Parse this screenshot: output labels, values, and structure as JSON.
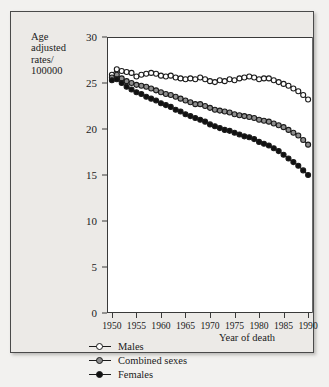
{
  "figure": {
    "y_axis_title_lines": [
      "Age",
      "adjusted",
      "rates/",
      "100000"
    ],
    "x_axis_title": "Year of death"
  },
  "legend": {
    "items": [
      {
        "label": "Males",
        "marker": "open-circle-icon",
        "color": "#ffffff"
      },
      {
        "label": "Combined sexes",
        "marker": "half-circle-icon",
        "color": "#8e8e8e"
      },
      {
        "label": "Females",
        "marker": "filled-circle-icon",
        "color": "#111111"
      }
    ]
  },
  "chart_data": {
    "type": "line",
    "title": "",
    "xlabel": "Year of death",
    "ylabel": "Age adjusted rates/ 100000",
    "xlim": [
      1949,
      1991
    ],
    "ylim": [
      0,
      30
    ],
    "xticks": [
      1950,
      1955,
      1960,
      1965,
      1970,
      1975,
      1980,
      1985,
      1990
    ],
    "yticks": [
      0,
      5,
      10,
      15,
      20,
      25,
      30
    ],
    "grid": false,
    "legend_position": "below-axes-left",
    "x": [
      1950,
      1951,
      1952,
      1953,
      1954,
      1955,
      1956,
      1957,
      1958,
      1959,
      1960,
      1961,
      1962,
      1963,
      1964,
      1965,
      1966,
      1967,
      1968,
      1969,
      1970,
      1971,
      1972,
      1973,
      1974,
      1975,
      1976,
      1977,
      1978,
      1979,
      1980,
      1981,
      1982,
      1983,
      1984,
      1985,
      1986,
      1987,
      1988,
      1989,
      1990
    ],
    "series": [
      {
        "name": "Males",
        "marker": "open-circle",
        "values": [
          25.9,
          26.5,
          26.3,
          26.2,
          26.1,
          25.7,
          25.9,
          26.0,
          26.1,
          26.0,
          25.8,
          25.7,
          25.8,
          25.6,
          25.5,
          25.4,
          25.5,
          25.4,
          25.6,
          25.4,
          25.2,
          25.1,
          25.3,
          25.2,
          25.4,
          25.3,
          25.5,
          25.6,
          25.7,
          25.6,
          25.4,
          25.5,
          25.5,
          25.3,
          25.1,
          24.9,
          24.7,
          24.4,
          24.1,
          23.7,
          23.2
        ]
      },
      {
        "name": "Combined sexes",
        "marker": "half-circle",
        "values": [
          25.6,
          25.9,
          25.5,
          25.2,
          25.0,
          24.8,
          24.7,
          24.6,
          24.4,
          24.2,
          24.0,
          23.8,
          23.7,
          23.5,
          23.3,
          23.1,
          22.9,
          22.7,
          22.7,
          22.5,
          22.3,
          22.1,
          22.0,
          21.9,
          21.8,
          21.6,
          21.5,
          21.4,
          21.3,
          21.2,
          21.0,
          20.9,
          20.8,
          20.6,
          20.4,
          20.2,
          19.9,
          19.6,
          19.3,
          18.8,
          18.3
        ]
      },
      {
        "name": "Females",
        "marker": "filled-circle",
        "values": [
          25.3,
          25.4,
          25.0,
          24.6,
          24.3,
          24.0,
          23.8,
          23.5,
          23.3,
          23.1,
          22.8,
          22.6,
          22.4,
          22.1,
          21.9,
          21.6,
          21.4,
          21.2,
          21.0,
          20.8,
          20.5,
          20.3,
          20.1,
          19.9,
          19.8,
          19.6,
          19.4,
          19.2,
          19.1,
          18.9,
          18.6,
          18.4,
          18.2,
          17.9,
          17.6,
          17.2,
          16.8,
          16.4,
          16.0,
          15.5,
          15.0
        ]
      }
    ]
  }
}
